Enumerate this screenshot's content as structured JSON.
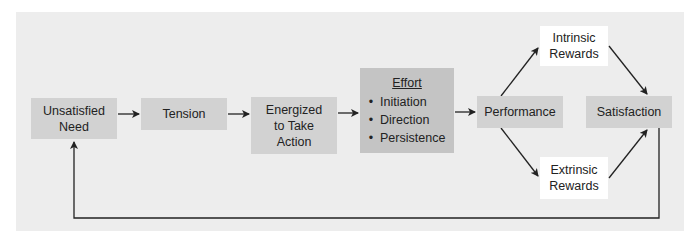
{
  "diagram": {
    "nodes": {
      "unsatisfied_need": {
        "line1": "Unsatisfied",
        "line2": "Need"
      },
      "tension": {
        "label": "Tension"
      },
      "energized": {
        "line1": "Energized",
        "line2": "to Take",
        "line3": "Action"
      },
      "effort": {
        "title": "Effort",
        "items": [
          "Initiation",
          "Direction",
          "Persistence"
        ]
      },
      "performance": {
        "label": "Performance"
      },
      "intrinsic_rewards": {
        "line1": "Intrinsic",
        "line2": "Rewards"
      },
      "extrinsic_rewards": {
        "line1": "Extrinsic",
        "line2": "Rewards"
      },
      "satisfaction": {
        "label": "Satisfaction"
      }
    },
    "edges": [
      [
        "Unsatisfied Need",
        "Tension"
      ],
      [
        "Tension",
        "Energized to Take Action"
      ],
      [
        "Energized to Take Action",
        "Effort"
      ],
      [
        "Effort",
        "Performance"
      ],
      [
        "Performance",
        "Intrinsic Rewards"
      ],
      [
        "Performance",
        "Extrinsic Rewards"
      ],
      [
        "Intrinsic Rewards",
        "Satisfaction"
      ],
      [
        "Extrinsic Rewards",
        "Satisfaction"
      ],
      [
        "Satisfaction",
        "Unsatisfied Need"
      ]
    ],
    "colors": {
      "panel": "#ededed",
      "box": "#d2d2d2",
      "effort_box": "#c4c4c4",
      "reward_box": "#ffffff",
      "arrow": "#222222"
    }
  }
}
